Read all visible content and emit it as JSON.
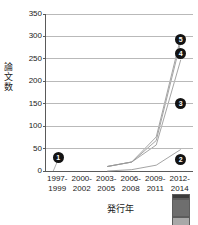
{
  "chart_data": {
    "type": "bar",
    "title": "",
    "subtitle": "",
    "xlabel": "発行年",
    "ylabel": "論文数",
    "categories": [
      "1997-\n1999",
      "2000-\n2002",
      "2003-\n2005",
      "2006-\n2008",
      "2009-\n2011",
      "2012-\n2014"
    ],
    "category_lines": [
      [
        "1997-",
        "1999"
      ],
      [
        "2000-",
        "2002"
      ],
      [
        "2003-",
        "2005"
      ],
      [
        "2006-",
        "2008"
      ],
      [
        "2009-",
        "2011"
      ],
      [
        "2012-",
        "2014"
      ]
    ],
    "ylim": [
      0,
      350
    ],
    "yticks": [
      0,
      50,
      100,
      150,
      200,
      250,
      300,
      350
    ],
    "ytick_labels": [
      "0",
      "50",
      "100",
      "150",
      "200",
      "250",
      "300",
      "350"
    ],
    "grid": true,
    "legend_position": "none",
    "stacked": true,
    "series": [
      {
        "name": "segment-light",
        "color": "#e4e4e4",
        "values": [
          0,
          0,
          0,
          3,
          13,
          48
        ]
      },
      {
        "name": "segment-mid",
        "color": "#a8a8a8",
        "values": [
          0,
          0,
          10,
          17,
          45,
          200
        ]
      },
      {
        "name": "segment-dark",
        "color": "#6e6e6e",
        "values": [
          0,
          0,
          0,
          0,
          10,
          40
        ]
      },
      {
        "name": "segment-darkest",
        "color": "#3b3b3b",
        "values": [
          0,
          0,
          0,
          0,
          8,
          10
        ]
      }
    ],
    "totals": [
      0,
      0,
      10,
      20,
      76,
      298
    ],
    "annotations": [
      {
        "label": "1",
        "category": "1997-1999",
        "value": 30
      },
      {
        "label": "2",
        "category": "2012-2014",
        "value": 25
      },
      {
        "label": "3",
        "category": "2012-2014",
        "value": 150
      },
      {
        "label": "4",
        "category": "2012-2014",
        "value": 262
      },
      {
        "label": "5",
        "category": "2012-2014",
        "value": 293
      }
    ],
    "trend_lines": [
      {
        "name": "trend-a",
        "points": [
          [
            2,
            0
          ],
          [
            3,
            3
          ],
          [
            4,
            13
          ],
          [
            5,
            48
          ]
        ]
      },
      {
        "name": "trend-b",
        "points": [
          [
            2,
            10
          ],
          [
            3,
            20
          ],
          [
            4,
            58
          ],
          [
            5,
            248
          ]
        ]
      },
      {
        "name": "trend-c",
        "points": [
          [
            2,
            10
          ],
          [
            3,
            20
          ],
          [
            4,
            68
          ],
          [
            5,
            288
          ]
        ]
      },
      {
        "name": "trend-d",
        "points": [
          [
            2,
            10
          ],
          [
            3,
            20
          ],
          [
            4,
            76
          ],
          [
            5,
            298
          ]
        ]
      }
    ]
  },
  "axis": {
    "y_title_chars": [
      "論",
      "文",
      "数"
    ],
    "x_title": "発行年"
  },
  "colors": {
    "axis": "#5a5a5a",
    "grid": "#b9b9b9",
    "text": "#1a1a1a",
    "callout_bg": "#131313",
    "callout_fg": "#ffffff"
  }
}
